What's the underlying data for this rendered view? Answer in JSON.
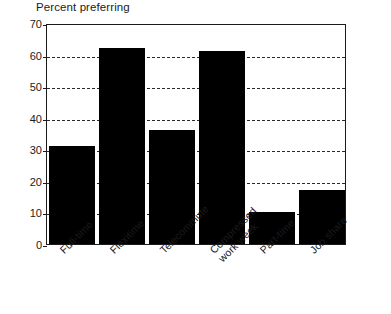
{
  "chart_data": {
    "type": "bar",
    "title": "Percent preferring",
    "xlabel": "",
    "ylabel": "",
    "ylim": [
      0,
      70
    ],
    "yticks": [
      0,
      10,
      20,
      30,
      40,
      50,
      60,
      70
    ],
    "gridlines": [
      10,
      20,
      30,
      40,
      50,
      60
    ],
    "grid": true,
    "legend": "none",
    "bar_color": "#000000",
    "categories": [
      "Full-time",
      "Flexitime",
      "Telecommute",
      "Compressed\nwork week",
      "Part-time",
      "Job share"
    ],
    "values": [
      31,
      62,
      36,
      61,
      10,
      17
    ]
  },
  "axis": {
    "y_tick_labels": [
      "0",
      "10",
      "20",
      "30",
      "40",
      "50",
      "60",
      "70"
    ]
  }
}
